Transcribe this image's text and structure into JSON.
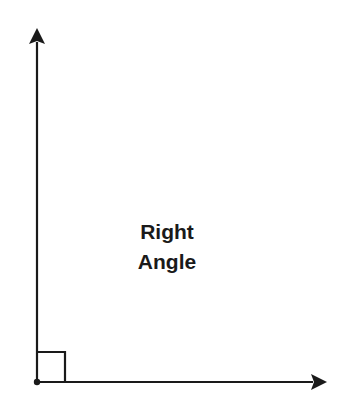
{
  "diagram": {
    "label_line1": "Right",
    "label_line2": "Angle",
    "stroke_color": "#1a1a1a",
    "vertex": {
      "x": 37,
      "y": 382
    },
    "vertical_ray_tip": {
      "x": 37,
      "y": 28
    },
    "horizontal_ray_tip": {
      "x": 327,
      "y": 382
    },
    "right_angle_marker_size": 28
  }
}
